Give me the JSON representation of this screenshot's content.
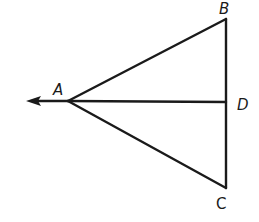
{
  "diagram": {
    "type": "geometry-figure",
    "points": {
      "A": {
        "label": "A"
      },
      "B": {
        "label": "B"
      },
      "C": {
        "label": "C"
      },
      "D": {
        "label": "D"
      }
    },
    "segments": [
      {
        "name": "AB",
        "from": "A",
        "to": "B"
      },
      {
        "name": "AC",
        "from": "A",
        "to": "C"
      },
      {
        "name": "AD",
        "from": "A",
        "to": "D"
      },
      {
        "name": "BC",
        "from": "B",
        "to": "C",
        "contains": "D"
      }
    ],
    "rays": [
      {
        "name": "ray-from-A",
        "origin": "A",
        "direction": "left (extension of DA beyond A)"
      }
    ],
    "colors": {
      "stroke": "#1a1a1a",
      "background": "#ffffff"
    }
  }
}
